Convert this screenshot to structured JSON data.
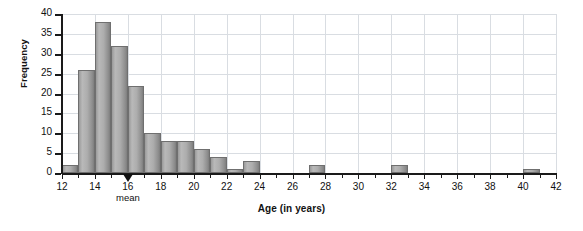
{
  "chart_data": {
    "type": "bar",
    "title": "",
    "xlabel": "Age (in years)",
    "ylabel": "Frequency",
    "xlim": [
      12,
      42
    ],
    "ylim": [
      0,
      40
    ],
    "bin_width": 1,
    "grid": true,
    "legend": null,
    "x_tick_labels": [
      "12",
      "14",
      "16",
      "18",
      "20",
      "22",
      "24",
      "26",
      "28",
      "30",
      "32",
      "34",
      "36",
      "38",
      "40",
      "42"
    ],
    "x_tick_values": [
      12,
      14,
      16,
      18,
      20,
      22,
      24,
      26,
      28,
      30,
      32,
      34,
      36,
      38,
      40,
      42
    ],
    "x_minor_ticks": [
      13,
      15,
      17,
      19,
      21,
      23,
      25,
      27,
      29,
      31,
      33,
      35,
      37,
      39,
      41
    ],
    "y_tick_labels": [
      "0",
      "5",
      "10",
      "15",
      "20",
      "25",
      "30",
      "35",
      "40"
    ],
    "y_tick_values": [
      0,
      5,
      10,
      15,
      20,
      25,
      30,
      35,
      40
    ],
    "bins": [
      {
        "start": 12,
        "end": 13,
        "value": 2
      },
      {
        "start": 13,
        "end": 14,
        "value": 26
      },
      {
        "start": 14,
        "end": 15,
        "value": 38
      },
      {
        "start": 15,
        "end": 16,
        "value": 32
      },
      {
        "start": 16,
        "end": 17,
        "value": 22
      },
      {
        "start": 17,
        "end": 18,
        "value": 10
      },
      {
        "start": 18,
        "end": 19,
        "value": 8
      },
      {
        "start": 19,
        "end": 20,
        "value": 8
      },
      {
        "start": 20,
        "end": 21,
        "value": 6
      },
      {
        "start": 21,
        "end": 22,
        "value": 4
      },
      {
        "start": 22,
        "end": 23,
        "value": 1
      },
      {
        "start": 23,
        "end": 24,
        "value": 3
      },
      {
        "start": 27,
        "end": 28,
        "value": 2
      },
      {
        "start": 32,
        "end": 33,
        "value": 2
      },
      {
        "start": 40,
        "end": 41,
        "value": 1
      }
    ],
    "annotations": [
      {
        "name": "mean-marker",
        "label": "mean",
        "x": 16,
        "marker": "up-triangle",
        "color": "#111111"
      }
    ],
    "colors": {
      "bar_fill": "#adadad",
      "bar_edge": "#6f6f6f",
      "grid": "#d9dde2",
      "axis": "#1a1a1a",
      "text": "#111111",
      "background": "#ffffff"
    }
  }
}
